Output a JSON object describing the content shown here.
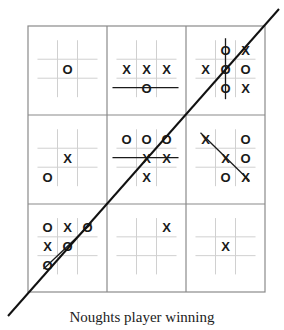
{
  "caption": "Noughts player winning",
  "colors": {
    "outer_grid": "#8a8a8a",
    "mini_grid": "#d0d0d0",
    "marks": "#1a1a1a",
    "win_line": "#111111"
  },
  "outer_grid": {
    "left": 28,
    "top": 26,
    "right": 265,
    "bottom": 292,
    "col_dividers": [
      107,
      186
    ],
    "row_dividers": [
      115,
      204
    ]
  },
  "meta_win_line": {
    "x1": 8,
    "y1": 316,
    "x2": 279,
    "y2": 9,
    "label": "diagonal through boards 7, 5, 3"
  },
  "boards": [
    {
      "index": 0,
      "cells": [
        "",
        "",
        "",
        "",
        "O",
        "",
        "",
        "",
        ""
      ],
      "strike": null
    },
    {
      "index": 1,
      "cells": [
        "",
        "",
        "",
        "X",
        "X",
        "X",
        "",
        "O",
        ""
      ],
      "strike": "row-2"
    },
    {
      "index": 2,
      "cells": [
        "",
        "O",
        "X",
        "X",
        "O",
        "O",
        "",
        "O",
        "X"
      ],
      "strike": "col-2"
    },
    {
      "index": 3,
      "cells": [
        "",
        "",
        "",
        "",
        "X",
        "",
        "O",
        "",
        ""
      ],
      "strike": null
    },
    {
      "index": 4,
      "cells": [
        "O",
        "O",
        "O",
        "",
        "X",
        "X",
        "",
        "X",
        ""
      ],
      "strike": "row-1"
    },
    {
      "index": 5,
      "cells": [
        "X",
        "",
        "O",
        "",
        "X",
        "O",
        "",
        "O",
        "X"
      ],
      "strike": "diag"
    },
    {
      "index": 6,
      "cells": [
        "O",
        "X",
        "O",
        "X",
        "O",
        "",
        "O",
        "",
        ""
      ],
      "strike": "anti-diag"
    },
    {
      "index": 7,
      "cells": [
        "",
        "",
        "X",
        "",
        "",
        "",
        "",
        "",
        ""
      ],
      "strike": null
    },
    {
      "index": 8,
      "cells": [
        "",
        "",
        "",
        "",
        "X",
        "",
        "",
        "",
        ""
      ],
      "strike": null
    }
  ]
}
